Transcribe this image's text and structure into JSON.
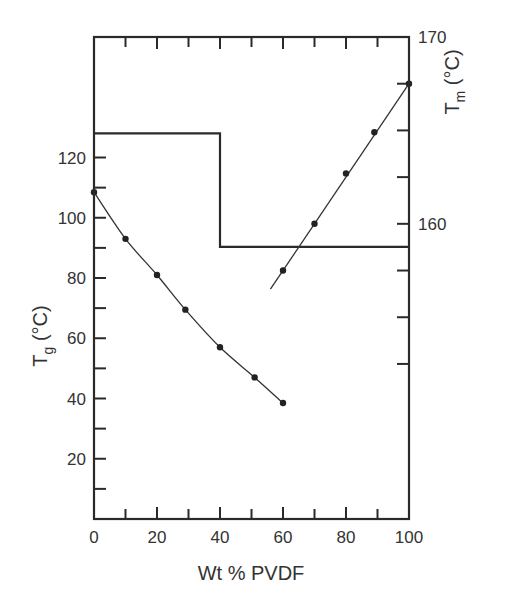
{
  "chart_data": {
    "type": "line",
    "title": "",
    "xlabel": "Wt % PVDF",
    "ylabel_left": {
      "base": "T",
      "sub": "g",
      "unit": " (°C)"
    },
    "ylabel_right": {
      "base": "T",
      "sub": "m",
      "unit": " (°C)"
    },
    "xlim": [
      0,
      100
    ],
    "ylim_left": [
      0,
      160
    ],
    "ylim_right": [
      144.2,
      170
    ],
    "x_ticks": [
      0,
      20,
      40,
      60,
      80,
      100
    ],
    "x_minor_step": 10,
    "y_left_ticks": [
      20,
      40,
      60,
      80,
      100,
      120
    ],
    "y_left_minor": [
      10,
      30,
      50,
      70,
      90,
      110
    ],
    "y_right_ticks": [
      160,
      170
    ],
    "y_right_minor": [
      152.5,
      155,
      157.5,
      162.5,
      165,
      167.5
    ],
    "grid": false,
    "legend": null,
    "series": [
      {
        "name": "Tg",
        "axis": "left",
        "x": [
          0,
          10,
          20,
          29,
          40,
          51,
          60
        ],
        "values": [
          108.5,
          93,
          81,
          69.5,
          57,
          47,
          38.5
        ]
      },
      {
        "name": "Tm",
        "axis": "right",
        "x": [
          60,
          70,
          80,
          89,
          100
        ],
        "values": [
          157.5,
          160,
          162.7,
          164.9,
          167.5
        ],
        "line_extends_to_x": 56
      }
    ],
    "annotations": [
      {
        "type": "step_boundary",
        "description": "Horizontal line at Tg≈128 from 0 to 40 wt%, drops at 40 wt% to ≈90 (left axis), continues to 100 wt%",
        "points": [
          [
            0,
            128
          ],
          [
            40,
            128
          ],
          [
            40,
            90.3
          ],
          [
            100,
            90.3
          ]
        ]
      }
    ]
  },
  "labels": {
    "x_tick_labels": [
      "0",
      "20",
      "40",
      "60",
      "80",
      "100"
    ],
    "y_left_tick_labels": [
      "20",
      "40",
      "60",
      "80",
      "100",
      "120"
    ],
    "y_right_tick_labels": [
      "160",
      "170"
    ],
    "xlabel": "Wt % PVDF",
    "ylabel_left_base": "T",
    "ylabel_left_sub": "g",
    "ylabel_left_unit": " (°C)",
    "ylabel_right_base": "T",
    "ylabel_right_sub": "m",
    "ylabel_right_unit": " (°C)"
  }
}
